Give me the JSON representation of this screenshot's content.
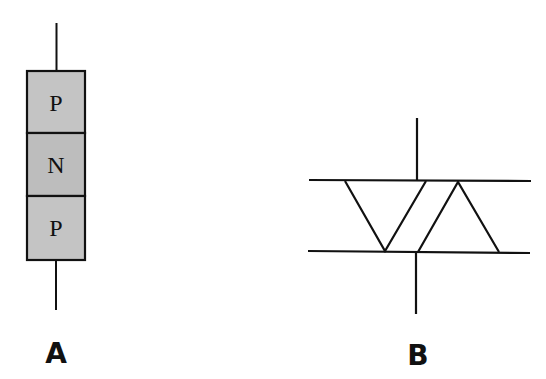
{
  "diagram_a": {
    "label": "A",
    "layers": [
      {
        "name": "top",
        "text": "P"
      },
      {
        "name": "middle",
        "text": "N"
      },
      {
        "name": "bottom",
        "text": "P"
      }
    ],
    "fill_color": "#c4c4c4",
    "stroke_color": "#111111"
  },
  "diagram_b": {
    "label": "B",
    "stroke_color": "#111111"
  }
}
